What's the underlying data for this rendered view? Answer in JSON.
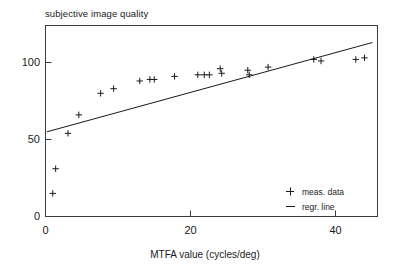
{
  "chart_data": {
    "type": "scatter",
    "title": "subjective image quality",
    "xlabel": "MTFA  value (cycles/deg)",
    "ylabel": "",
    "xlim": [
      -0.5,
      46.0
    ],
    "ylim": [
      0,
      124
    ],
    "xticks": [
      0,
      20,
      40
    ],
    "xtick_labels": [
      "0",
      "20",
      "40"
    ],
    "yticks": [
      0,
      50,
      100
    ],
    "ytick_labels": [
      "0",
      "50",
      "100"
    ],
    "grid": false,
    "legend_position": "lower-right",
    "series": [
      {
        "name": "meas. data",
        "marker": "plus",
        "points": [
          [
            1.0,
            15
          ],
          [
            1.4,
            31
          ],
          [
            3.1,
            54
          ],
          [
            4.6,
            66
          ],
          [
            7.6,
            80
          ],
          [
            9.4,
            83
          ],
          [
            13.0,
            88
          ],
          [
            14.4,
            89
          ],
          [
            15.0,
            89
          ],
          [
            17.8,
            91
          ],
          [
            21.0,
            92
          ],
          [
            21.9,
            92
          ],
          [
            22.6,
            92
          ],
          [
            24.1,
            96
          ],
          [
            24.3,
            93
          ],
          [
            27.9,
            95
          ],
          [
            28.1,
            92
          ],
          [
            30.7,
            97
          ],
          [
            37.0,
            102
          ],
          [
            38.0,
            101
          ],
          [
            42.8,
            102
          ],
          [
            44.0,
            103
          ]
        ]
      },
      {
        "name": "regr. line",
        "marker": "line",
        "line_endpoints": [
          [
            0.2,
            55.0
          ],
          [
            45.1,
            113.0
          ]
        ]
      }
    ],
    "legend": [
      {
        "label": "meas. data",
        "symbol": "plus"
      },
      {
        "label": "regr. line",
        "symbol": "line"
      }
    ],
    "colors": {
      "data": "#1a1a1a",
      "line": "#1a1a1a",
      "frame": "#3c3c3c",
      "background": "#ffffff"
    }
  }
}
